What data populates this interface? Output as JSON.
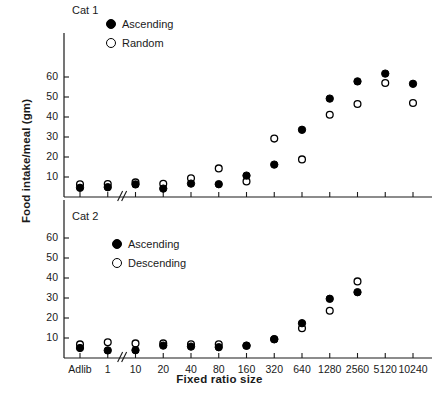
{
  "chart_data": {
    "type": "scatter",
    "title": "",
    "xlabel": "Fixed ratio size",
    "ylabel": "Food intake/meal (gm)",
    "categories": [
      "Adlib",
      "1",
      "10",
      "20",
      "40",
      "80",
      "160",
      "320",
      "640",
      "1280",
      "2560",
      "5120",
      "10240"
    ],
    "ylim": [
      0,
      68
    ],
    "yticks": [
      10,
      20,
      30,
      40,
      50,
      60
    ],
    "grid": false,
    "legend_position": "upper-left-inside",
    "axis_break_after_category": "1",
    "panels": [
      {
        "name": "Cat 1",
        "label": "Cat 1",
        "series": [
          {
            "name": "Ascending",
            "marker": "filled-circle",
            "values": [
              4.6,
              4.9,
              6.3,
              4.2,
              6.7,
              6.4,
              10.7,
              16.2,
              33.6,
              49.2,
              57.8,
              61.7,
              56.6
            ]
          },
          {
            "name": "Random",
            "marker": "open-circle",
            "values": [
              6.4,
              6.5,
              7.3,
              6.6,
              9.4,
              14.3,
              7.8,
              29.2,
              18.8,
              41.1,
              46.5,
              57.0,
              47.0
            ]
          }
        ]
      },
      {
        "name": "Cat 2",
        "label": "Cat 2",
        "series": [
          {
            "name": "Ascending",
            "marker": "filled-circle",
            "values": [
              5.0,
              3.8,
              3.9,
              6.2,
              5.7,
              5.4,
              6.2,
              9.4,
              17.4,
              29.6,
              32.9,
              null,
              null
            ]
          },
          {
            "name": "Descending",
            "marker": "open-circle",
            "values": [
              6.8,
              7.9,
              7.3,
              7.3,
              6.9,
              6.9,
              6.1,
              9.4,
              14.9,
              23.6,
              38.3,
              null,
              null
            ]
          }
        ]
      }
    ]
  },
  "axes": {
    "ylabel": "Food intake/meal (gm)",
    "xlabel": "Fixed ratio size",
    "yticks": [
      "60",
      "50",
      "40",
      "30",
      "20",
      "10"
    ],
    "xticks": [
      "Adlib",
      "1",
      "10",
      "20",
      "40",
      "80",
      "160",
      "320",
      "640",
      "1280",
      "2560",
      "5120",
      "10240"
    ]
  },
  "panel1": {
    "title": "Cat 1",
    "legend": [
      {
        "label": "Ascending",
        "marker": "filled-circle"
      },
      {
        "label": "Random",
        "marker": "open-circle"
      }
    ]
  },
  "panel2": {
    "title": "Cat 2",
    "legend": [
      {
        "label": "Ascending",
        "marker": "filled-circle"
      },
      {
        "label": "Descending",
        "marker": "open-circle"
      }
    ]
  },
  "colors": {
    "ink": "#000000",
    "background": "#ffffff"
  }
}
